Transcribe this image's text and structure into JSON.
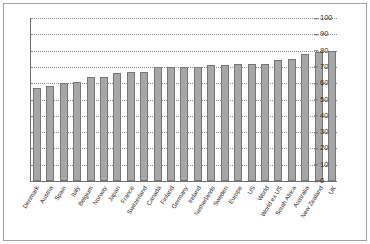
{
  "chart_data": {
    "type": "bar",
    "title": "",
    "subtitle": "",
    "xlabel": "",
    "ylabel": "",
    "ylim": [
      0,
      100
    ],
    "yticks": [
      0,
      10,
      20,
      30,
      40,
      50,
      60,
      70,
      80,
      90,
      100
    ],
    "grid": true,
    "grid_style": "dotted-horizontal",
    "legend": "none",
    "yaxis_position": "right",
    "xtick_rotation": -58,
    "categories": [
      "Denmark",
      "Austria",
      "Spain",
      "Italy",
      "Belgium",
      "Norway",
      "Japan",
      "France",
      "Switzerland",
      "Canada",
      "Finland",
      "Germany",
      "Ireland",
      "Netherlands",
      "Sweden",
      "Europe",
      "US",
      "World",
      "World ex US",
      "South Africa",
      "Australia",
      "New Zealand",
      "UK"
    ],
    "values": [
      57,
      58,
      60,
      61,
      64,
      64,
      66,
      67,
      67,
      70,
      70,
      70,
      70,
      71,
      71,
      72,
      72,
      72,
      74,
      75,
      78,
      79,
      80
    ],
    "colors": {
      "bar_fill": "#a6a6a6",
      "bar_edge": "#767676",
      "gridline": "#8d8d8d",
      "axis": "#6e6e6e",
      "text": "#2b2b2b",
      "frame": "#9aa0a6",
      "background": "#ffffff"
    }
  }
}
